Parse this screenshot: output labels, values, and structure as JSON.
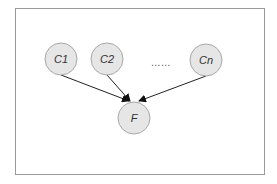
{
  "diagram": {
    "type": "directed-graph",
    "frame": {
      "x": 15,
      "y": 8,
      "width": 249,
      "height": 166,
      "stroke": "#9a9a9a"
    },
    "node_style": {
      "fill": "#e6e6e6",
      "stroke": "#a8a8a8",
      "radius": 16,
      "text_color": "#333333"
    },
    "nodes": [
      {
        "id": "C1",
        "label": "C1",
        "cx": 61,
        "cy": 59
      },
      {
        "id": "C2",
        "label": "C2",
        "cx": 107,
        "cy": 59
      },
      {
        "id": "Cn",
        "label": "Cn",
        "cx": 206,
        "cy": 60
      },
      {
        "id": "F",
        "label": "F",
        "cx": 134,
        "cy": 118
      }
    ],
    "ellipsis": {
      "label": "……",
      "x": 161,
      "y": 66
    },
    "edges": [
      {
        "from": "C1",
        "to": "F"
      },
      {
        "from": "C2",
        "to": "F"
      },
      {
        "from": "Cn",
        "to": "F"
      }
    ],
    "edge_color": "#222222"
  }
}
